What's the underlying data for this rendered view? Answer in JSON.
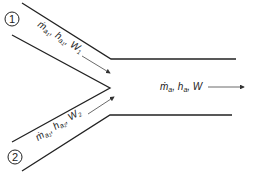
{
  "diagram": {
    "stream1": {
      "marker": "1",
      "label_m": "ṁ",
      "label": "ṁa1, ha1, W1",
      "parts": [
        "ṁ",
        "a",
        "1",
        ", h",
        "a",
        "1",
        ", W",
        "1"
      ]
    },
    "stream2": {
      "marker": "2",
      "label": "ṁa1, ha2, W2",
      "parts": [
        "ṁ",
        "a",
        "1",
        ", h",
        "a",
        "2",
        ", W",
        "2"
      ]
    },
    "outlet": {
      "label": "ṁa, ha, W",
      "parts": [
        "ṁ",
        "a",
        ", h",
        "a",
        ", W"
      ]
    },
    "colors": {
      "line": "#222222",
      "arrow": "#444444"
    }
  }
}
